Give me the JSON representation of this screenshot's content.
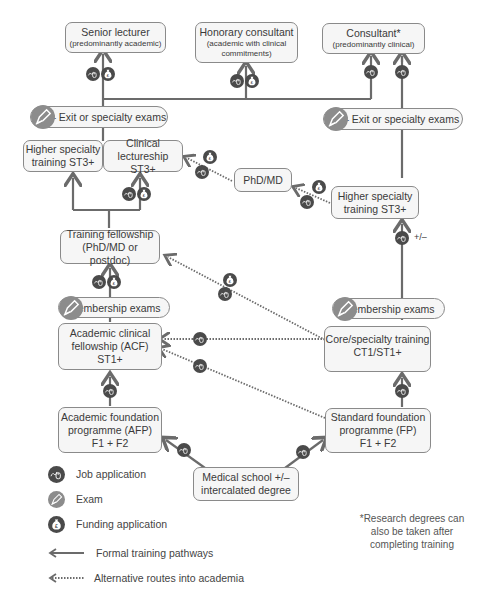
{
  "boxes": {
    "senior_lecturer": {
      "title": "Senior lecturer",
      "sub": "(predominantly academic)"
    },
    "honorary_consultant": {
      "title": "Honorary consultant",
      "sub1": "(academic with clinical",
      "sub2": "commitments)"
    },
    "consultant": {
      "title": "Consultant*",
      "sub": "(predominantly clinical)"
    },
    "higher_specialty_left": {
      "line1": "Higher specialty",
      "line2": "training ST3+"
    },
    "clinical_lectureship": {
      "line1": "Clinical",
      "line2": "lectureship ST3+"
    },
    "phd_md": {
      "line1": "PhD/MD"
    },
    "higher_specialty_right": {
      "line1": "Higher specialty",
      "line2": "training ST3+"
    },
    "training_fellowship": {
      "line1": "Training fellowship",
      "line2": "(PhD/MD or postdoc)"
    },
    "acf": {
      "line1": "Academic clinical",
      "line2": "fellowship (ACF)",
      "line3": "ST1+"
    },
    "core_training": {
      "line1": "Core/specialty training",
      "line2": "CT1/ST1+"
    },
    "afp": {
      "line1": "Academic foundation",
      "line2": "programme (AFP)",
      "line3": "F1 + F2"
    },
    "fp": {
      "line1": "Standard foundation",
      "line2": "programme (FP)",
      "line3": "F1 + F2"
    },
    "medical_school": {
      "line1": "Medical school +/–",
      "line2": "intercalated degree"
    }
  },
  "pills": {
    "exit_exams_left": "+/– Exit or specialty exams",
    "exit_exams_right": "+/– Exit or specialty exams",
    "membership_left": "Membership exams",
    "membership_right": "Membership exams"
  },
  "annotations": {
    "plus_minus": "+/–"
  },
  "legend": {
    "items": [
      {
        "icon": "job-application-icon",
        "label": "Job application"
      },
      {
        "icon": "exam-icon",
        "label": "Exam"
      },
      {
        "icon": "funding-application-icon",
        "label": "Funding application"
      },
      {
        "icon": "solid-arrow-icon",
        "label": "Formal training pathways"
      },
      {
        "icon": "dotted-arrow-icon",
        "label": "Alternative routes into academia"
      }
    ]
  },
  "footnote": {
    "line1": "*Research degrees can",
    "line2": "also be taken after",
    "line3": "completing training"
  },
  "colors": {
    "line": "#6b6b6b",
    "icon_dark": "#4a4a4a",
    "icon_exam": "#8c8c8c",
    "box_bg": "#f6f6f6",
    "box_border": "#8a8a8a"
  }
}
